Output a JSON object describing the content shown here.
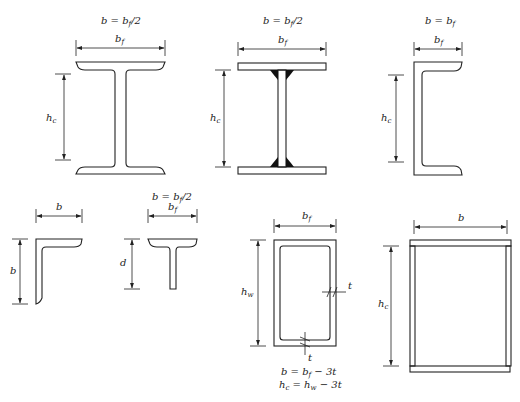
{
  "diagram": {
    "sections": [
      {
        "id": "rolled-i-beam",
        "shape": "I-section (rolled, rounded fillets)",
        "equation": "b = bf/2",
        "equation_parts": {
          "lhs": "b = b",
          "sub": "f",
          "rhs": "/2"
        },
        "width_label": {
          "main": "b",
          "sub": "f"
        },
        "height_label": {
          "main": "h",
          "sub": "c"
        }
      },
      {
        "id": "welded-i-beam",
        "shape": "I-section (welded plates, fillet welds)",
        "equation": "b = bf/2",
        "equation_parts": {
          "lhs": "b = b",
          "sub": "f",
          "rhs": "/2"
        },
        "width_label": {
          "main": "b",
          "sub": "f"
        },
        "height_label": {
          "main": "h",
          "sub": "c"
        }
      },
      {
        "id": "channel",
        "shape": "Channel (C-section)",
        "equation": "b = bf",
        "equation_parts": {
          "lhs": "b = b",
          "sub": "f",
          "rhs": ""
        },
        "width_label": {
          "main": "b",
          "sub": "f"
        },
        "height_label": {
          "main": "h",
          "sub": "c"
        }
      },
      {
        "id": "angle",
        "shape": "Angle (L-section)",
        "width_label": {
          "main": "b",
          "sub": ""
        },
        "height_label": {
          "main": "b",
          "sub": ""
        }
      },
      {
        "id": "tee",
        "shape": "Tee (T-section)",
        "equation": "b = bf/2",
        "equation_parts": {
          "lhs": "b = b",
          "sub": "f",
          "rhs": "/2"
        },
        "width_label": {
          "main": "b",
          "sub": "f"
        },
        "height_label": {
          "main": "d",
          "sub": ""
        }
      },
      {
        "id": "rectangular-hss",
        "shape": "Rectangular hollow structural section",
        "width_label": {
          "main": "b",
          "sub": "f"
        },
        "height_label": {
          "main": "h",
          "sub": "w"
        },
        "thickness_label_right": "t",
        "thickness_label_bottom": "t",
        "equations": [
          {
            "lhs": "b = b",
            "sub": "f",
            "rhs": " − 3t"
          },
          {
            "lhs": "h",
            "lhs_sub": "c",
            "mid": " = h",
            "sub": "w",
            "rhs": " − 3t"
          }
        ],
        "equation_text": [
          "b = bf − 3t",
          "hc = hw − 3t"
        ]
      },
      {
        "id": "built-up-box",
        "shape": "Built-up box section",
        "width_label": {
          "main": "b",
          "sub": ""
        },
        "height_label": {
          "main": "h",
          "sub": "c"
        }
      }
    ]
  }
}
